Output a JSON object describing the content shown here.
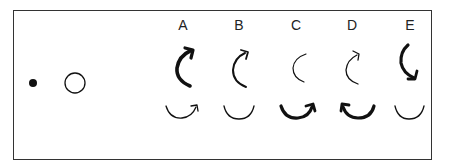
{
  "figure": {
    "columns": [
      {
        "label": "A",
        "x": 183
      },
      {
        "label": "B",
        "x": 239
      },
      {
        "label": "C",
        "x": 296
      },
      {
        "label": "D",
        "x": 352
      },
      {
        "label": "E",
        "x": 410
      }
    ],
    "left_symbols": [
      {
        "name": "filled-dot",
        "cx": 33,
        "cy": 83,
        "r": 4
      },
      {
        "name": "hollow-circle",
        "cx": 75,
        "cy": 83,
        "r": 10
      }
    ],
    "colors": {
      "stroke": "#111111",
      "border": "#333333",
      "background": "#ffffff"
    }
  }
}
